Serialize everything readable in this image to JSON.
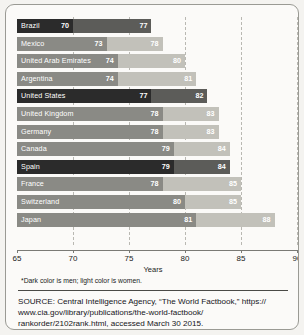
{
  "chart_data": {
    "type": "bar",
    "orientation": "horizontal",
    "stacked_style": "overlapping-range",
    "title": "",
    "xlabel": "Years",
    "ylabel": "",
    "xlim": [
      65,
      90
    ],
    "xticks": [
      65,
      70,
      75,
      80,
      85,
      90
    ],
    "grid": "vertical-dashed",
    "legend": "none",
    "categories": [
      "Brazil",
      "Mexico",
      "United Arab Emirates",
      "Argentina",
      "United States",
      "United Kingdom",
      "Germany",
      "Canada",
      "Spain",
      "France",
      "Switzerland",
      "Japan"
    ],
    "series": [
      {
        "name": "Men",
        "values": [
          70,
          73,
          74,
          74,
          77,
          78,
          78,
          79,
          79,
          78,
          80,
          81
        ]
      },
      {
        "name": "Women",
        "values": [
          77,
          78,
          80,
          81,
          82,
          83,
          83,
          84,
          84,
          85,
          85,
          88
        ]
      }
    ],
    "highlighted": [
      "United States",
      "Spain"
    ],
    "colors": {
      "men": "#8a8a85",
      "women": "#c2c1ba",
      "men_highlight": "#2b2b2b",
      "women_highlight": "#5c5c59",
      "gridline": "#b9b8b2",
      "axis": "#7a7a75",
      "card_background": "#fbfaf8",
      "page_background": "#f4f3f0"
    },
    "rows": [
      {
        "country": "Brazil",
        "men": 70,
        "women": 77,
        "highlight": true
      },
      {
        "country": "Mexico",
        "men": 73,
        "women": 78,
        "highlight": false
      },
      {
        "country": "United Arab Emirates",
        "men": 74,
        "women": 80,
        "highlight": false
      },
      {
        "country": "Argentina",
        "men": 74,
        "women": 81,
        "highlight": false
      },
      {
        "country": "United States",
        "men": 77,
        "women": 82,
        "highlight": true
      },
      {
        "country": "United Kingdom",
        "men": 78,
        "women": 83,
        "highlight": false
      },
      {
        "country": "Germany",
        "men": 78,
        "women": 83,
        "highlight": false
      },
      {
        "country": "Canada",
        "men": 79,
        "women": 84,
        "highlight": false
      },
      {
        "country": "Spain",
        "men": 79,
        "women": 84,
        "highlight": true
      },
      {
        "country": "France",
        "men": 78,
        "women": 85,
        "highlight": false
      },
      {
        "country": "Switzerland",
        "men": 80,
        "women": 85,
        "highlight": false
      },
      {
        "country": "Japan",
        "men": 81,
        "women": 88,
        "highlight": false
      }
    ]
  },
  "axis": {
    "title": "Years",
    "tick_labels": [
      "65",
      "70",
      "75",
      "80",
      "85",
      "90"
    ]
  },
  "footnote": {
    "text": "*Dark color is men; light color is women."
  },
  "source": {
    "line1": "SOURCE: Central Intelligence Agency, “The World Factbook,” https://",
    "line2": "www.cia.gov/library/publications/the-world-factbook/",
    "line3": "rankorder/2102rank.html, accessed March 30 2015."
  }
}
